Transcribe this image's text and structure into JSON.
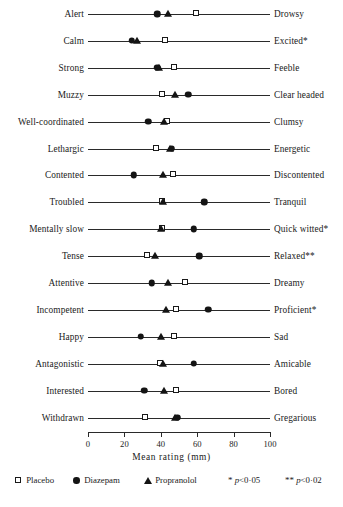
{
  "chart_data": {
    "type": "scatter",
    "title": "",
    "xlabel": "Mean rating (mm)",
    "ylabel": "",
    "xlim": [
      0,
      100
    ],
    "xticks": [
      0,
      20,
      40,
      60,
      80,
      100
    ],
    "grid": false,
    "legend_position": "bottom",
    "series": [
      {
        "name": "Placebo",
        "marker": "open-square"
      },
      {
        "name": "Diazepam",
        "marker": "filled-circle"
      },
      {
        "name": "Propranolol",
        "marker": "filled-triangle"
      }
    ],
    "categories": [
      {
        "left": "Alert",
        "right": "Drowsy",
        "sig": "",
        "placebo": 60,
        "diazepam": 38,
        "propranolol": 44
      },
      {
        "left": "Calm",
        "right": "Excited",
        "sig": "*",
        "placebo": 43,
        "diazepam": 24,
        "propranolol": 27
      },
      {
        "left": "Strong",
        "right": "Feeble",
        "sig": "",
        "placebo": 48,
        "diazepam": 38,
        "propranolol": 39
      },
      {
        "left": "Muzzy",
        "right": "Clear headed",
        "sig": "",
        "placebo": 41,
        "diazepam": 55,
        "propranolol": 48
      },
      {
        "left": "Well-coordinated",
        "right": "Clumsy",
        "sig": "",
        "placebo": 44,
        "diazepam": 33,
        "propranolol": 42
      },
      {
        "left": "Lethargic",
        "right": "Energetic",
        "sig": "",
        "placebo": 38,
        "diazepam": 46,
        "propranolol": 45
      },
      {
        "left": "Contented",
        "right": "Discontented",
        "sig": "",
        "placebo": 47,
        "diazepam": 25,
        "propranolol": 41
      },
      {
        "left": "Troubled",
        "right": "Tranquil",
        "sig": "",
        "placebo": 41,
        "diazepam": 64,
        "propranolol": 41
      },
      {
        "left": "Mentally slow",
        "right": "Quick witted",
        "sig": "*",
        "placebo": 41,
        "diazepam": 58,
        "propranolol": 40
      },
      {
        "left": "Tense",
        "right": "Relaxed",
        "sig": "**",
        "placebo": 33,
        "diazepam": 61,
        "propranolol": 37
      },
      {
        "left": "Attentive",
        "right": "Dreamy",
        "sig": "",
        "placebo": 54,
        "diazepam": 35,
        "propranolol": 44
      },
      {
        "left": "Incompetent",
        "right": "Proficient",
        "sig": "*",
        "placebo": 49,
        "diazepam": 66,
        "propranolol": 43
      },
      {
        "left": "Happy",
        "right": "Sad",
        "sig": "",
        "placebo": 48,
        "diazepam": 29,
        "propranolol": 40
      },
      {
        "left": "Antagonistic",
        "right": "Amicable",
        "sig": "",
        "placebo": 40,
        "diazepam": 58,
        "propranolol": 41
      },
      {
        "left": "Interested",
        "right": "Bored",
        "sig": "",
        "placebo": 49,
        "diazepam": 31,
        "propranolol": 42
      },
      {
        "left": "Withdrawn",
        "right": "Gregarious",
        "sig": "",
        "placebo": 32,
        "diazepam": 49,
        "propranolol": 48
      }
    ],
    "footnotes": [
      {
        "symbol": "*",
        "text": "p < 0·05"
      },
      {
        "symbol": "**",
        "text": "p < 0·02"
      }
    ]
  },
  "axis": {
    "title": "Mean rating (mm)",
    "tick_labels": [
      "0",
      "20",
      "40",
      "60",
      "80",
      "100"
    ]
  },
  "legend": {
    "placebo_label": "Placebo",
    "diazepam_label": "Diazepam",
    "propranolol_label": "Propranolol",
    "sig1_symbol": "*",
    "sig1_text_p": "p",
    "sig1_text_rest": "<0·05",
    "sig2_symbol": "**",
    "sig2_text_p": "p",
    "sig2_text_rest": "<0·02"
  },
  "colors": {
    "ink": "#1a1a1a",
    "line": "#2a2a2a",
    "paper": "#ffffff"
  }
}
